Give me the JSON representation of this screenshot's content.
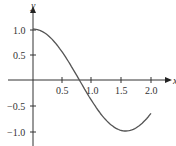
{
  "chart_data": {
    "type": "line",
    "title": "",
    "xlabel": "x",
    "ylabel": "y",
    "xlim": [
      0,
      2.1
    ],
    "ylim": [
      -1.15,
      1.15
    ],
    "x_ticks": [
      "0.5",
      "1.0",
      "1.5",
      "2.0"
    ],
    "y_ticks": [
      "1.0",
      "0.5",
      "−0.5",
      "−1.0"
    ],
    "grid": false,
    "legend": null,
    "series": [
      {
        "name": "y = cos(2x)",
        "x": [
          0,
          0.25,
          0.5,
          0.75,
          0.785,
          1.0,
          1.25,
          1.5,
          1.571,
          1.75,
          2.0
        ],
        "y": [
          1.0,
          0.88,
          0.54,
          0.07,
          0.0,
          -0.42,
          -0.8,
          -0.99,
          -1.0,
          -0.94,
          -0.65
        ]
      }
    ],
    "line_color": "#555555"
  },
  "labels": {
    "x_axis": "x",
    "y_axis": "y",
    "xt1": "0.5",
    "xt2": "1.0",
    "xt3": "1.5",
    "xt4": "2.0",
    "yt1": "1.0",
    "yt2": "0.5",
    "yt3": "−0.5",
    "yt4": "−1.0"
  }
}
